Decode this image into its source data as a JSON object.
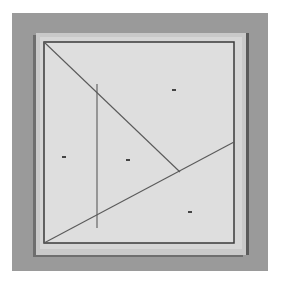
{
  "image": {
    "description": "Photograph of a square sheet of paper mounted on a board, with pencil lines drawn forming a geometric figure",
    "colors": {
      "background": "#9a9a9a",
      "paper": "#dcdcdc",
      "lines": "#555555",
      "frame": "#3a3a3a"
    }
  },
  "drawing": {
    "square": {
      "x1": 44,
      "y1": 42,
      "x2": 234,
      "y2": 243
    },
    "lines": [
      {
        "name": "diagonal-from-top-left",
        "x1": 44,
        "y1": 42,
        "x2": 180,
        "y2": 172
      },
      {
        "name": "line-from-bottom-left",
        "x1": 44,
        "y1": 243,
        "x2": 234,
        "y2": 142
      },
      {
        "name": "vertical-line",
        "x1": 97,
        "y1": 84,
        "x2": 97,
        "y2": 228
      }
    ],
    "marks": [
      {
        "x": 174,
        "y": 90
      },
      {
        "x": 128,
        "y": 160
      },
      {
        "x": 64,
        "y": 157
      },
      {
        "x": 190,
        "y": 212
      }
    ]
  }
}
